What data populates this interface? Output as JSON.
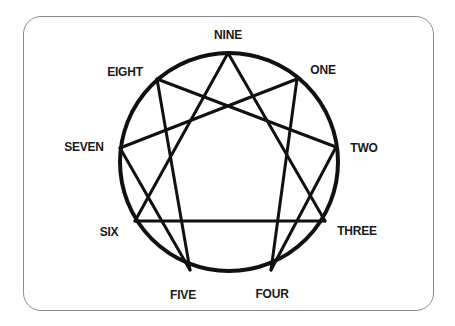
{
  "diagram": {
    "type": "enneagram",
    "frame": {
      "border_color": "#8a8a8a",
      "corner_radius": 18
    },
    "circle": {
      "cx": 229,
      "cy": 162,
      "r": 109,
      "stroke": "#111111",
      "stroke_width": 4
    },
    "line_color": "#111111",
    "points": [
      {
        "id": "9",
        "label": "NINE",
        "x": 228,
        "y": 53,
        "lx": 228,
        "ly": 35
      },
      {
        "id": "1",
        "label": "ONE",
        "x": 297,
        "y": 79,
        "lx": 323,
        "ly": 70
      },
      {
        "id": "2",
        "label": "TWO",
        "x": 336,
        "y": 147,
        "lx": 364,
        "ly": 148
      },
      {
        "id": "3",
        "label": "THREE",
        "x": 325,
        "y": 221,
        "lx": 357,
        "ly": 231
      },
      {
        "id": "4",
        "label": "FOUR",
        "x": 271,
        "y": 270,
        "lx": 272,
        "ly": 294
      },
      {
        "id": "5",
        "label": "FIVE",
        "x": 190,
        "y": 270,
        "lx": 183,
        "ly": 295
      },
      {
        "id": "6",
        "label": "SIX",
        "x": 135,
        "y": 221,
        "lx": 109,
        "ly": 232
      },
      {
        "id": "7",
        "label": "SEVEN",
        "x": 120,
        "y": 148,
        "lx": 84,
        "ly": 147
      },
      {
        "id": "8",
        "label": "EIGHT",
        "x": 157,
        "y": 79,
        "lx": 125,
        "ly": 72
      }
    ],
    "edges": [
      [
        "9",
        "3"
      ],
      [
        "3",
        "6"
      ],
      [
        "6",
        "9"
      ],
      [
        "1",
        "4"
      ],
      [
        "4",
        "2"
      ],
      [
        "2",
        "8"
      ],
      [
        "8",
        "5"
      ],
      [
        "5",
        "7"
      ],
      [
        "7",
        "1"
      ]
    ]
  }
}
